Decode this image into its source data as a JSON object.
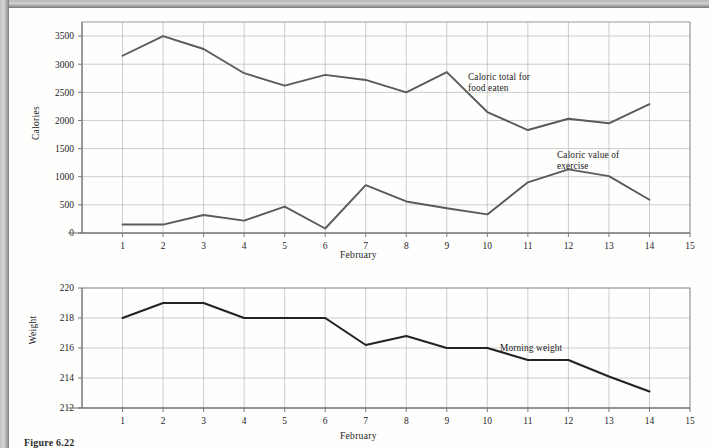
{
  "figure": {
    "caption": "Figure 6.22"
  },
  "chart_data": [
    {
      "type": "line",
      "id": "calories-chart",
      "title": "",
      "xlabel": "February",
      "ylabel": "Calories",
      "x": [
        1,
        2,
        3,
        4,
        5,
        6,
        7,
        8,
        9,
        10,
        11,
        12,
        13,
        14
      ],
      "xlim": [
        0,
        15
      ],
      "xticks": [
        1,
        2,
        3,
        4,
        5,
        6,
        7,
        8,
        9,
        10,
        11,
        12,
        13,
        14,
        15
      ],
      "ylim": [
        0,
        3750
      ],
      "yticks": [
        0,
        500,
        1000,
        1500,
        2000,
        2500,
        3000,
        3500
      ],
      "grid": true,
      "legend_position": "inline-annotation",
      "series": [
        {
          "name": "Caloric total for food eaten",
          "annotation": "Caloric total for\nfood eaten",
          "values": [
            3150,
            3500,
            3270,
            2840,
            2620,
            2810,
            2720,
            2500,
            2860,
            2150,
            1830,
            2030,
            1950,
            2290
          ]
        },
        {
          "name": "Caloric value of exercise",
          "annotation": "Caloric value of\nexercise",
          "values": [
            150,
            150,
            320,
            220,
            470,
            80,
            850,
            560,
            440,
            330,
            900,
            1130,
            1010,
            590,
            1100
          ]
        }
      ]
    },
    {
      "type": "line",
      "id": "weight-chart",
      "title": "",
      "xlabel": "February",
      "ylabel": "Weight",
      "x": [
        1,
        2,
        3,
        4,
        5,
        6,
        7,
        8,
        9,
        10,
        11,
        12,
        13,
        14
      ],
      "xlim": [
        0,
        15
      ],
      "xticks": [
        1,
        2,
        3,
        4,
        5,
        6,
        7,
        8,
        9,
        10,
        11,
        12,
        13,
        14,
        15
      ],
      "ylim": [
        212,
        220
      ],
      "yticks": [
        212,
        214,
        216,
        218,
        220
      ],
      "grid": true,
      "legend_position": "inline-annotation",
      "series": [
        {
          "name": "Morning weight",
          "annotation": "Morning weight",
          "values": [
            218.0,
            219.0,
            219.0,
            218.0,
            218.0,
            218.0,
            216.2,
            216.8,
            216.0,
            216.0,
            215.2,
            215.2,
            214.1,
            213.1
          ]
        }
      ]
    }
  ]
}
